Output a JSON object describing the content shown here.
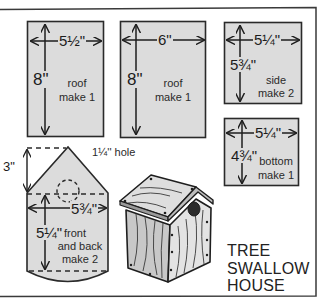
{
  "diagram": {
    "title_lines": [
      "TREE",
      "SWALLOW",
      "HOUSE"
    ],
    "colors": {
      "panel_fill": "#dcdcdc",
      "line": "#2a2a2a",
      "background": "#ffffff"
    },
    "parts": [
      {
        "id": "roof-a",
        "width_label": "5½\"",
        "height_label": "8\"",
        "name": "roof",
        "quantity": "make 1"
      },
      {
        "id": "roof-b",
        "width_label": "6\"",
        "height_label": "8\"",
        "name": "roof",
        "quantity": "make 1"
      },
      {
        "id": "side",
        "width_label": "5¼\"",
        "height_label": "5¾\"",
        "name": "side",
        "quantity": "make 2"
      },
      {
        "id": "bottom",
        "width_label": "5¼\"",
        "height_label": "4¾\"",
        "name": "bottom",
        "quantity": "make 1"
      },
      {
        "id": "front-back",
        "width_label": "5¾\"",
        "height_label": "5¼\"",
        "peak_label": "3\"",
        "name_line1": "front",
        "name_line2": "and back",
        "quantity": "make 2",
        "hole_label": "1¼'' hole"
      }
    ],
    "illustration": "assembled-birdhouse"
  }
}
